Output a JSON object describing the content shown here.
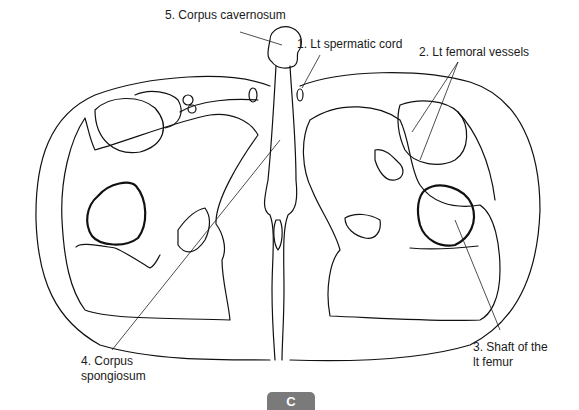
{
  "figure": {
    "panel_label": "C",
    "labels": [
      {
        "id": "corpus-cavernosum",
        "text": "5. Corpus cavernosum"
      },
      {
        "id": "lt-spermatic-cord",
        "text": "1. Lt spermatic cord"
      },
      {
        "id": "lt-femoral-vessels",
        "text": "2. Lt femoral vessels"
      },
      {
        "id": "shaft-lt-femur-line1",
        "text": "3. Shaft of the"
      },
      {
        "id": "shaft-lt-femur-line2",
        "text": "lt femur"
      },
      {
        "id": "corpus-spongiosum-line1",
        "text": "4. Corpus"
      },
      {
        "id": "corpus-spongiosum-line2",
        "text": "spongiosum"
      }
    ],
    "colors": {
      "line": "#111111",
      "badge_bg": "#7a7a7a",
      "badge_text": "#ffffff",
      "background": "#ffffff"
    }
  }
}
